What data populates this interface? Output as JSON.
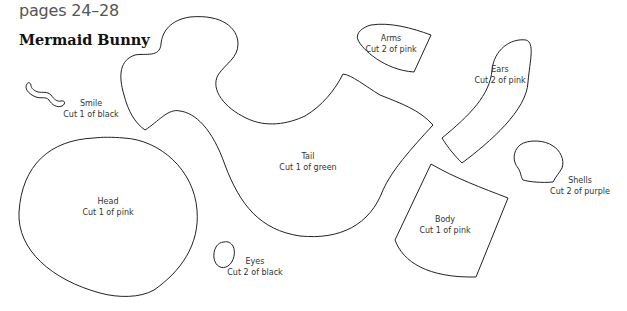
{
  "header": {
    "pages": "pages 24–28",
    "title": "Mermaid Bunny"
  },
  "pieces": [
    {
      "id": "smile",
      "name": "Smile",
      "instruction": "Cut 1 of black"
    },
    {
      "id": "arms",
      "name": "Arms",
      "instruction": "Cut 2 of pink"
    },
    {
      "id": "ears",
      "name": "Ears",
      "instruction": "Cut 2 of pink"
    },
    {
      "id": "tail",
      "name": "Tail",
      "instruction": "Cut 1 of green"
    },
    {
      "id": "shells",
      "name": "Shells",
      "instruction": "Cut 2 of purple"
    },
    {
      "id": "head",
      "name": "Head",
      "instruction": "Cut 1 of pink"
    },
    {
      "id": "body",
      "name": "Body",
      "instruction": "Cut 1 of pink"
    },
    {
      "id": "eyes",
      "name": "Eyes",
      "instruction": "Cut 2 of black"
    }
  ],
  "colors": {
    "outline": "#222222",
    "text": "#333333",
    "background": "#ffffff"
  }
}
